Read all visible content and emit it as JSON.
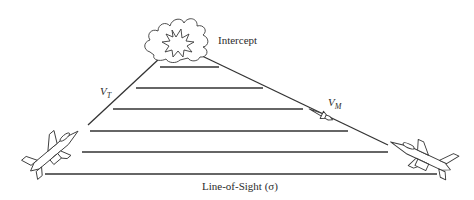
{
  "diagram": {
    "labels": {
      "intercept": "Intercept",
      "target_velocity": "V",
      "target_velocity_sub": "T",
      "missile_velocity": "V",
      "missile_velocity_sub": "M",
      "line_of_sight": "Line-of-Sight (σ)"
    },
    "nodes": [
      {
        "id": "target-aircraft",
        "description": "fighter jet (target) at left, climbing toward intercept"
      },
      {
        "id": "missile-aircraft",
        "description": "fighter jet (launcher) at right"
      },
      {
        "id": "missile",
        "description": "missile on path toward intercept"
      },
      {
        "id": "intercept",
        "description": "explosion cloud at apex"
      }
    ],
    "edges": [
      {
        "from": "target-aircraft",
        "to": "intercept",
        "label": "V_T"
      },
      {
        "from": "missile-aircraft",
        "to": "intercept",
        "label": "V_M"
      },
      {
        "from": "missile-aircraft",
        "to": "target-aircraft",
        "label": "Line-of-Sight (σ)"
      }
    ],
    "los_lines_count": 6,
    "colors": {
      "line": "#333333",
      "background": "#ffffff"
    }
  }
}
